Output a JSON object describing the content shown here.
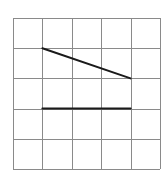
{
  "grid": {
    "rows": 5,
    "cols": 5,
    "origin_x": 13,
    "origin_y": 18,
    "cell_w": 29.4,
    "cell_h": 30.2,
    "line_color": "#8a8a8a",
    "line_width": 1
  },
  "segments": [
    {
      "name": "diagonal-segment",
      "from": [
        1,
        1
      ],
      "to": [
        4,
        2
      ],
      "color": "#1a1a1a",
      "width": 2
    },
    {
      "name": "horizontal-segment",
      "from": [
        1,
        3
      ],
      "to": [
        4,
        3
      ],
      "color": "#1a1a1a",
      "width": 2
    }
  ]
}
